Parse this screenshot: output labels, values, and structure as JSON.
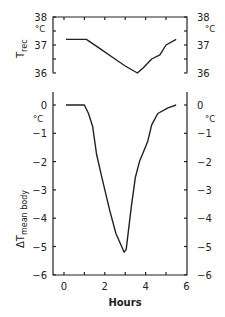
{
  "chart_data": [
    {
      "type": "line",
      "panel": "top",
      "title": "",
      "xlabel": "Hours",
      "ylabel": "T_rec",
      "ylabel_main": "T",
      "ylabel_sub": "rec",
      "yunit": "°C",
      "xlim": [
        -0.5,
        6
      ],
      "ylim": [
        36,
        38
      ],
      "yticks": [
        36,
        37,
        38
      ],
      "ytick_labels": [
        "36",
        "37",
        "38"
      ],
      "grid": false,
      "series": [
        {
          "name": "T_rec",
          "x": [
            0.1,
            1.1,
            1.8,
            2.5,
            3.0,
            3.6,
            3.9,
            4.3,
            4.7,
            5.0,
            5.5
          ],
          "values": [
            37.2,
            37.2,
            36.85,
            36.5,
            36.25,
            36.0,
            36.2,
            36.5,
            36.65,
            37.0,
            37.2
          ]
        }
      ]
    },
    {
      "type": "line",
      "panel": "bottom",
      "title": "",
      "xlabel": "Hours",
      "ylabel": "ΔT mean body",
      "ylabel_main": "ΔT",
      "ylabel_sub": "mean body",
      "yunit": "°C",
      "xlim": [
        -0.5,
        6
      ],
      "ylim": [
        -6,
        0.5
      ],
      "xticks": [
        0,
        1,
        2,
        3,
        4,
        5,
        6
      ],
      "xtick_labels": [
        "0",
        "2",
        "4",
        "6"
      ],
      "yticks": [
        0,
        -1,
        -2,
        -3,
        -4,
        -5,
        -6
      ],
      "ytick_labels": [
        "0",
        "−1",
        "−2",
        "−3",
        "−4",
        "−5",
        "−6"
      ],
      "grid": false,
      "series": [
        {
          "name": "ΔT mean body",
          "x": [
            0.1,
            1.0,
            1.2,
            1.4,
            1.6,
            1.9,
            2.25,
            2.55,
            2.95,
            3.05,
            3.3,
            3.5,
            3.7,
            4.1,
            4.3,
            4.6,
            5.1,
            5.5
          ],
          "values": [
            0,
            0,
            -0.3,
            -0.75,
            -1.75,
            -2.7,
            -3.75,
            -4.55,
            -5.2,
            -5.1,
            -3.6,
            -2.55,
            -2.0,
            -1.3,
            -0.7,
            -0.3,
            -0.1,
            0
          ]
        }
      ]
    }
  ],
  "labels": {
    "top_ylabel_main": "T",
    "top_ylabel_sub": "rec",
    "bottom_ylabel_main": "ΔT",
    "bottom_ylabel_sub": "mean body",
    "unit": "°C",
    "xlabel": "Hours"
  }
}
